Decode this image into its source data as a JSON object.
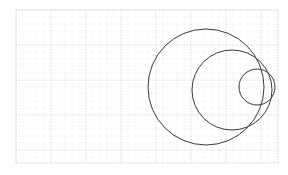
{
  "figure": {
    "width": 288,
    "height": 175,
    "background_color": "#ffffff",
    "title": "",
    "subtitle": ""
  },
  "plot_area": {
    "x": 16,
    "y": 10,
    "width": 262,
    "height": 153,
    "background_color": "#ffffff",
    "border_color": "#d8d8e0",
    "border_style": "dotted"
  },
  "grid": {
    "visible": true,
    "style": "dashed",
    "major_color": "#dcdce4",
    "minor_color": "#ececf2",
    "major_spacing_px": 35,
    "minor_spacing_px": 7,
    "major_x_positions": [
      16,
      51,
      86,
      121,
      156,
      191,
      226,
      261,
      278
    ],
    "major_y_positions": [
      10,
      45,
      80,
      115,
      150,
      163
    ]
  },
  "axes": {
    "x_tick_labels": [],
    "y_tick_labels": [],
    "xlabel": "",
    "ylabel": "",
    "ticks_visible": false
  },
  "chart_data": {
    "type": "scatter",
    "title": "",
    "subtitle": "",
    "xlabel": "",
    "ylabel": "",
    "grid": true,
    "legend": false,
    "legend_position": "none",
    "xlim": [
      16,
      278
    ],
    "ylim": [
      163,
      10
    ],
    "shapes": [
      {
        "name": "large-circle",
        "type": "circle",
        "cx": 206,
        "cy": 87,
        "r": 58,
        "stroke": "#3a3a3a",
        "stroke_width": 1.0,
        "fill": "none"
      },
      {
        "name": "medium-circle",
        "type": "circle",
        "cx": 232,
        "cy": 90,
        "r": 40,
        "stroke": "#3a3a3a",
        "stroke_width": 1.0,
        "fill": "none"
      },
      {
        "name": "small-circle",
        "type": "circle",
        "cx": 257,
        "cy": 87,
        "r": 18,
        "stroke": "#3a3a3a",
        "stroke_width": 1.0,
        "fill": "none"
      }
    ],
    "annotations": []
  }
}
